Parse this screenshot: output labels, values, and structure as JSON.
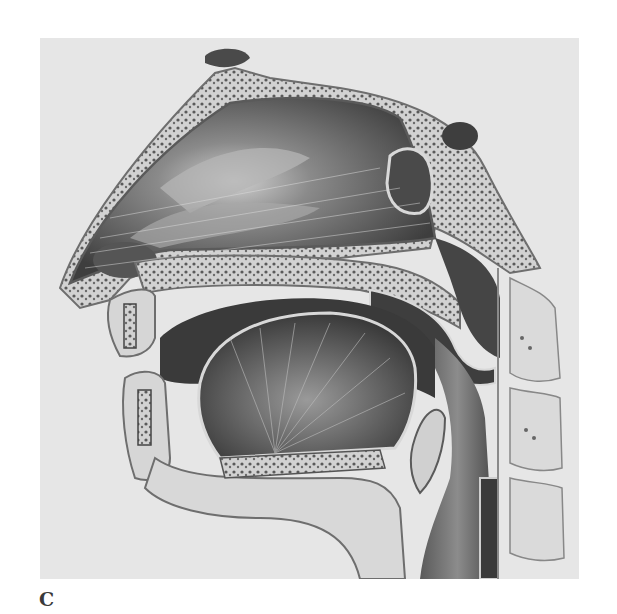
{
  "figure": {
    "caption_label": "C",
    "style": "grayscale pencil illustration",
    "colors": {
      "background": "#e6e6e6",
      "bone": "#d9d9d9",
      "bone_outline": "#6e6e6e",
      "cavity_dark": "#4a4a4a",
      "cavity_mid": "#7a7a7a",
      "highlight": "#cfcfcf",
      "marrow_dots": "#555555",
      "caption": "#3a3a3a"
    }
  }
}
